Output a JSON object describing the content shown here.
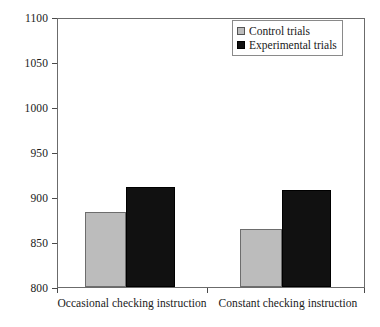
{
  "chart_data": {
    "type": "bar",
    "title": "",
    "xlabel": "",
    "ylabel": "",
    "ylim": [
      800,
      1100
    ],
    "yticks": [
      800,
      850,
      900,
      950,
      1000,
      1050,
      1100
    ],
    "grid": false,
    "legend_position": "top-right",
    "categories": [
      "Occasional checking instruction",
      "Constant checking instruction"
    ],
    "series": [
      {
        "name": "Control trials",
        "color": "#bcbcbc",
        "values": [
          883,
          864
        ]
      },
      {
        "name": "Experimental trials",
        "color": "#111111",
        "values": [
          911,
          908
        ]
      }
    ]
  },
  "legend": {
    "items": [
      {
        "label": "Control trials",
        "swatch": "control-swatch-icon"
      },
      {
        "label": "Experimental trials",
        "swatch": "experimental-swatch-icon"
      }
    ]
  },
  "axis": {
    "y_tick_labels": [
      "1100",
      "1050",
      "1000",
      "950",
      "900",
      "850",
      "800"
    ],
    "x_tick_labels": [
      "Occasional checking instruction",
      "Constant checking instruction"
    ]
  },
  "colors": {
    "control_fill": "#bcbcbc",
    "experimental_fill": "#111111",
    "frame": "#6b6b6b",
    "background": "#ffffff"
  }
}
